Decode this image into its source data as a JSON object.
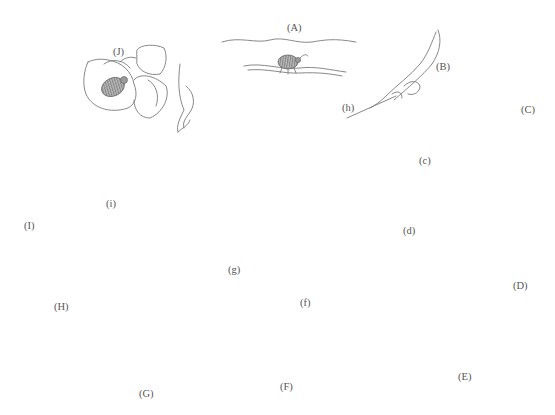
{
  "diagram": {
    "type": "life-cycle",
    "stages": [
      {
        "id": "A",
        "label": "(A)",
        "description": "adult weevil on bean pod"
      },
      {
        "id": "B",
        "label": "(B)",
        "description": "opened pod with eggs"
      },
      {
        "id": "C",
        "label": "(C)",
        "description": "larva burrowing into bean seed"
      },
      {
        "id": "D",
        "label": "(D)",
        "description": "larva feeding inside seed"
      },
      {
        "id": "E",
        "label": "(E)",
        "description": "seed with emergence window"
      },
      {
        "id": "F",
        "label": "(F)",
        "description": "pupa inside seed"
      },
      {
        "id": "G",
        "label": "(G)",
        "description": "adult emerging from seed"
      },
      {
        "id": "H",
        "label": "(H)",
        "description": "pod with eggs"
      },
      {
        "id": "I",
        "label": "(I)",
        "description": "egg cluster"
      },
      {
        "id": "J",
        "label": "(J)",
        "description": "adult on flower"
      }
    ],
    "insets": [
      {
        "id": "c",
        "label": "(c)",
        "description": "first instar larva"
      },
      {
        "id": "d",
        "label": "(d)",
        "description": "mature larva"
      },
      {
        "id": "f",
        "label": "(f)",
        "description": "pupa ventral view"
      },
      {
        "id": "g",
        "label": "(g)",
        "description": "adult weevil dorsal view"
      },
      {
        "id": "h",
        "label": "(h)",
        "description": "eggs"
      },
      {
        "id": "i",
        "label": "(i)",
        "description": "seed with eggs and adult"
      }
    ],
    "labels": {
      "A": "(A)",
      "B": "(B)",
      "C": "(C)",
      "D": "(D)",
      "E": "(E)",
      "F": "(F)",
      "G": "(G)",
      "H": "(H)",
      "I": "(I)",
      "J": "(J)",
      "c": "(c)",
      "d": "(d)",
      "f": "(f)",
      "g": "(g)",
      "h": "(h)",
      "i": "(i)"
    },
    "arrow_sequence": [
      "J→A",
      "A→B",
      "B→C",
      "C→D",
      "D→E",
      "E→F",
      "F→G",
      "G→H",
      "H→I",
      "I→J",
      "g→J"
    ],
    "colors": {
      "line": "#7a7a7a",
      "arrow": "#4a4a4a",
      "label": "#555555",
      "background": "#ffffff"
    }
  }
}
